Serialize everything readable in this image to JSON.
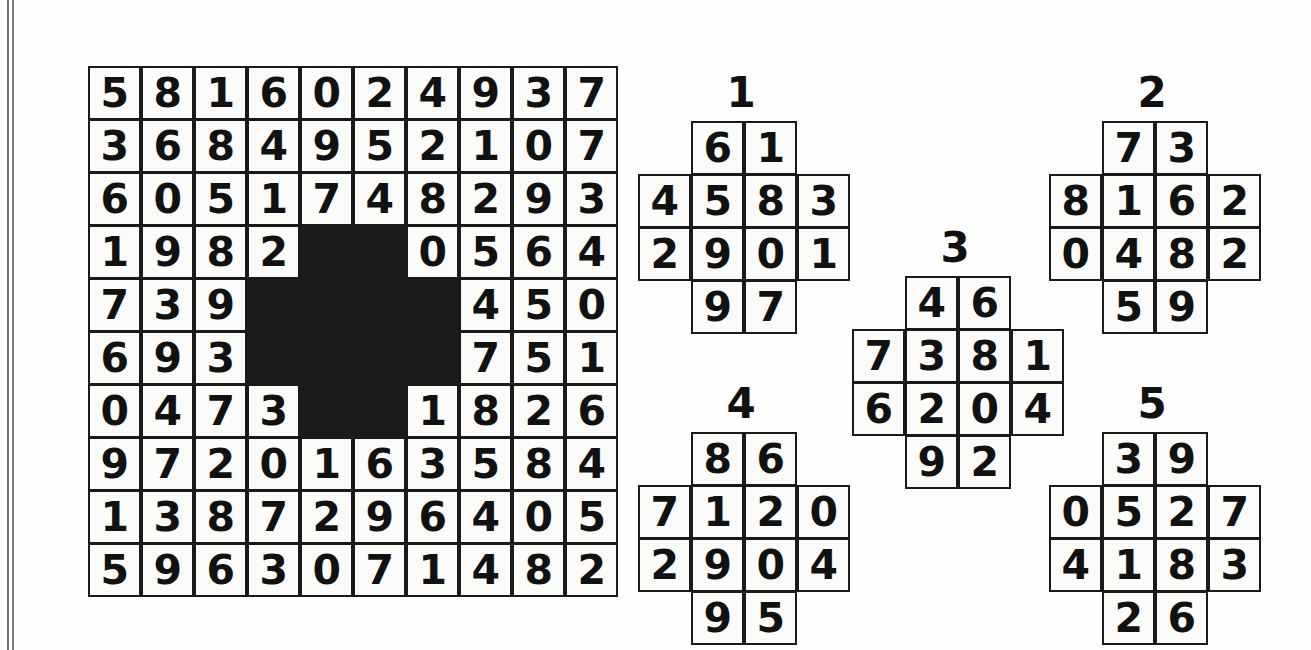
{
  "puzzle": {
    "type": "number-grid-fit-puzzle",
    "main_grid": {
      "name": "main-board",
      "rows": 10,
      "cols": 10,
      "blocked_marker": "#",
      "blank_marker": "",
      "cells": [
        [
          "5",
          "8",
          "1",
          "6",
          "0",
          "2",
          "4",
          "9",
          "3",
          "7"
        ],
        [
          "3",
          "6",
          "8",
          "4",
          "9",
          "5",
          "2",
          "1",
          "0",
          "7"
        ],
        [
          "6",
          "0",
          "5",
          "1",
          "7",
          "4",
          "8",
          "2",
          "9",
          "3"
        ],
        [
          "1",
          "9",
          "8",
          "2",
          "#",
          "#",
          "0",
          "5",
          "6",
          "4"
        ],
        [
          "7",
          "3",
          "9",
          "#",
          "#",
          "#",
          "#",
          "4",
          "5",
          "0"
        ],
        [
          "6",
          "9",
          "3",
          "#",
          "#",
          "#",
          "#",
          "7",
          "5",
          "1"
        ],
        [
          "0",
          "4",
          "7",
          "3",
          "#",
          "#",
          "1",
          "8",
          "2",
          "6"
        ],
        [
          "9",
          "7",
          "2",
          "0",
          "1",
          "6",
          "3",
          "5",
          "8",
          "4"
        ],
        [
          "1",
          "3",
          "8",
          "7",
          "2",
          "9",
          "6",
          "4",
          "0",
          "5"
        ],
        [
          "5",
          "9",
          "6",
          "3",
          "0",
          "7",
          "1",
          "4",
          "8",
          "2"
        ]
      ]
    },
    "pieces": [
      {
        "id": "piece-1",
        "label": "1",
        "rows": 4,
        "cols": 4,
        "cells": [
          [
            "",
            "6",
            "1",
            ""
          ],
          [
            "4",
            "5",
            "8",
            "3"
          ],
          [
            "2",
            "9",
            "0",
            "1"
          ],
          [
            "",
            "9",
            "7",
            ""
          ]
        ]
      },
      {
        "id": "piece-2",
        "label": "2",
        "rows": 4,
        "cols": 4,
        "cells": [
          [
            "",
            "7",
            "3",
            ""
          ],
          [
            "8",
            "1",
            "6",
            "2"
          ],
          [
            "0",
            "4",
            "8",
            "2"
          ],
          [
            "",
            "5",
            "9",
            ""
          ]
        ]
      },
      {
        "id": "piece-3",
        "label": "3",
        "rows": 4,
        "cols": 4,
        "cells": [
          [
            "",
            "4",
            "6",
            ""
          ],
          [
            "7",
            "3",
            "8",
            "1"
          ],
          [
            "6",
            "2",
            "0",
            "4"
          ],
          [
            "",
            "9",
            "2",
            ""
          ]
        ]
      },
      {
        "id": "piece-4",
        "label": "4",
        "rows": 4,
        "cols": 4,
        "cells": [
          [
            "",
            "8",
            "6",
            ""
          ],
          [
            "7",
            "1",
            "2",
            "0"
          ],
          [
            "2",
            "9",
            "0",
            "4"
          ],
          [
            "",
            "9",
            "5",
            ""
          ]
        ]
      },
      {
        "id": "piece-5",
        "label": "5",
        "rows": 4,
        "cols": 4,
        "cells": [
          [
            "",
            "3",
            "9",
            ""
          ],
          [
            "0",
            "5",
            "2",
            "7"
          ],
          [
            "4",
            "1",
            "8",
            "3"
          ],
          [
            "",
            "2",
            "6",
            ""
          ]
        ]
      }
    ],
    "colors": {
      "ink": "#111111",
      "cell_background": "#fbfbfa",
      "blocked": "#1b1b1b",
      "page_background": "#fefefe",
      "edge_rule": "#6f6f73"
    }
  }
}
